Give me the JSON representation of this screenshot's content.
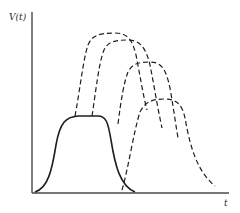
{
  "figure": {
    "y_axis_label": "V(t)",
    "x_axis_label": "t",
    "colors": {
      "axis": "#4a4a4a",
      "curve": "#1e1e1e",
      "background": "#ffffff"
    },
    "curves": [
      {
        "name": "solid-pulse",
        "style": "solid",
        "path": "M 35 192 C 48 188, 52 170, 56 145 C 60 122, 66 117, 78 116 L 98 116 C 106 116, 108 122, 111 140 C 115 165, 120 186, 135 192"
      },
      {
        "name": "dashed-pulse-1",
        "style": "dashed",
        "path": "M 75 116 C 80 90, 83 60, 88 45 C 92 35, 100 33, 115 33 C 126 33, 132 38, 136 55 C 140 75, 143 95, 147 110"
      },
      {
        "name": "dashed-pulse-2",
        "style": "dashed",
        "path": "M 92 116 C 96 90, 99 62, 104 50 C 108 42, 114 40, 128 40 C 140 40, 146 48, 150 65 C 154 85, 157 105, 162 128"
      },
      {
        "name": "dashed-pulse-3",
        "style": "dashed",
        "path": "M 118 124 C 121 100, 124 82, 128 72 C 132 64, 138 62, 150 62 C 162 62, 166 70, 170 88 C 173 105, 175 120, 178 138"
      },
      {
        "name": "dashed-pulse-4",
        "style": "dashed",
        "path": "M 122 190 C 128 170, 134 130, 140 112 C 145 102, 152 99, 165 99 C 176 99, 182 104, 185 118 C 189 140, 195 170, 215 186"
      }
    ]
  }
}
